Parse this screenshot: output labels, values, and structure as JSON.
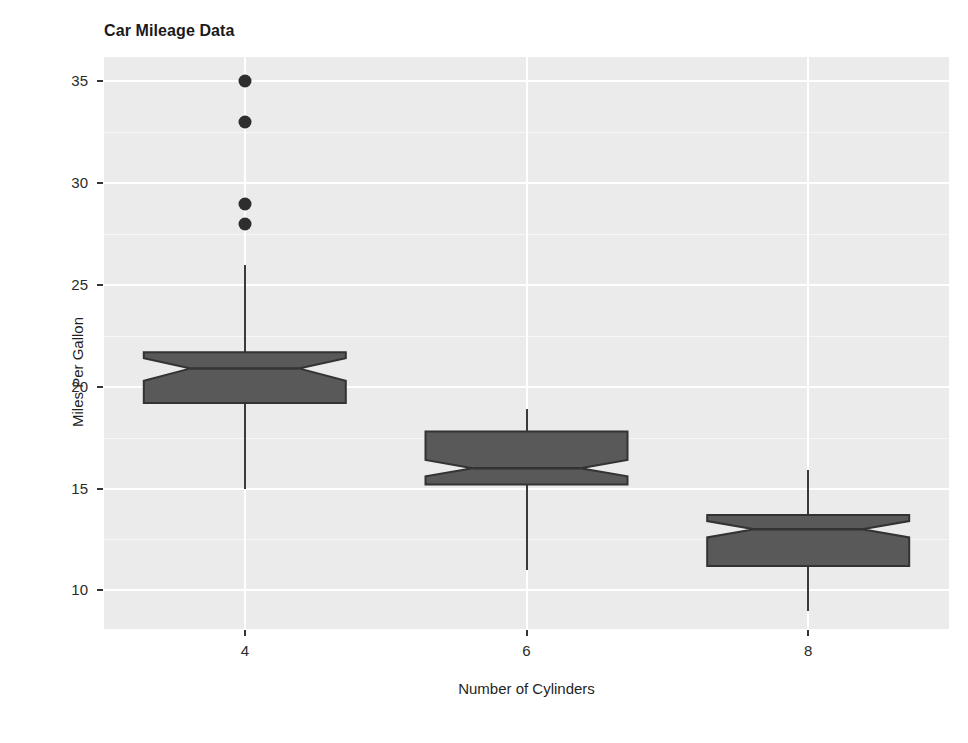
{
  "chart_data": {
    "type": "box",
    "title": "Car Mileage Data",
    "xlabel": "Number of Cylinders",
    "ylabel": "Miles Per Gallon",
    "notched": true,
    "grid": true,
    "legend": "none",
    "panel_background": "#ebebeb",
    "box_fill": "#595959",
    "box_stroke": "#333333",
    "outlier_color": "#2e2e2e",
    "categories": [
      "4",
      "6",
      "8"
    ],
    "xticks": [
      "4",
      "6",
      "8"
    ],
    "yticks": [
      "10",
      "15",
      "20",
      "25",
      "30",
      "35"
    ],
    "ylim": [
      8.1,
      36.2
    ],
    "boxes": [
      {
        "category": "4",
        "lower_whisker": 15.0,
        "q1": 19.2,
        "median": 20.9,
        "q3": 21.7,
        "upper_whisker": 26.0,
        "notch_lower": 20.3,
        "notch_upper": 21.4,
        "outliers": [
          28.0,
          29.0,
          33.0,
          35.0
        ]
      },
      {
        "category": "6",
        "lower_whisker": 11.0,
        "q1": 15.2,
        "median": 16.0,
        "q3": 17.8,
        "upper_whisker": 18.9,
        "notch_lower": 15.6,
        "notch_upper": 16.4,
        "outliers": []
      },
      {
        "category": "8",
        "lower_whisker": 9.0,
        "q1": 11.2,
        "median": 13.0,
        "q3": 13.7,
        "upper_whisker": 15.9,
        "notch_lower": 12.6,
        "notch_upper": 13.4,
        "outliers": []
      }
    ]
  }
}
